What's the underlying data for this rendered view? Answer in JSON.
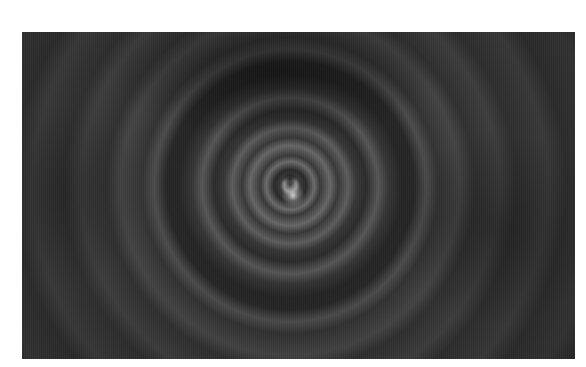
{
  "image": {
    "description": "Grayscale radial zoom-blur swirl photograph with concentric light rings",
    "colors": {
      "background": "#ffffff",
      "photo_base": "#2b2b2b",
      "ring_highlight": "#c8c8c8",
      "core_highlight": "#ebebeb"
    }
  }
}
